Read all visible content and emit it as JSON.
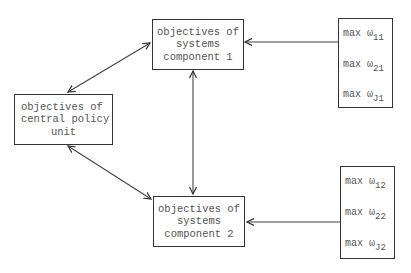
{
  "diagram": {
    "nodes": {
      "component1": {
        "lines": [
          "objectives of",
          "systems",
          "component 1"
        ]
      },
      "central": {
        "lines": [
          "objectives of",
          "central policy",
          "unit"
        ]
      },
      "component2": {
        "lines": [
          "objectives of",
          "systems",
          "component 2"
        ]
      }
    },
    "stacks": {
      "stack1": {
        "items": [
          {
            "prefix": "max ω",
            "sub": "11"
          },
          {
            "prefix": "max ω",
            "sub": "21"
          },
          {
            "prefix": "max ω",
            "sub": "J1"
          }
        ]
      },
      "stack2": {
        "items": [
          {
            "prefix": "max ω",
            "sub": "12"
          },
          {
            "prefix": "max ω",
            "sub": "22"
          },
          {
            "prefix": "max ω",
            "sub": "J2"
          }
        ]
      }
    },
    "edges": [
      {
        "from": "central",
        "to": "component1",
        "type": "bidirectional"
      },
      {
        "from": "central",
        "to": "component2",
        "type": "bidirectional"
      },
      {
        "from": "component1",
        "to": "component2",
        "type": "bidirectional"
      },
      {
        "from": "stack1",
        "to": "component1",
        "type": "directed"
      },
      {
        "from": "stack2",
        "to": "component2",
        "type": "directed"
      }
    ]
  }
}
